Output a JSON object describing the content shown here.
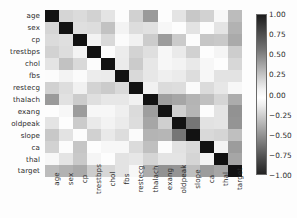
{
  "chart_data": {
    "type": "heatmap",
    "title": "",
    "xlabel": "",
    "ylabel": "",
    "grid": false,
    "colormap": "gray-diverging",
    "vmin": -1.0,
    "vmax": 1.0,
    "legend_position": "right",
    "categories": [
      "age",
      "sex",
      "cp",
      "trestbps",
      "chol",
      "fbs",
      "restecg",
      "thalach",
      "exang",
      "oldpeak",
      "slope",
      "ca",
      "thal",
      "target"
    ],
    "x_tick_labels": [
      "age",
      "sex",
      "cp",
      "trestbps",
      "chol",
      "fbs",
      "restecg",
      "thalach",
      "exang",
      "oldpeak",
      "slope",
      "ca",
      "thal",
      "target"
    ],
    "y_tick_labels": [
      "age",
      "sex",
      "cp",
      "trestbps",
      "chol",
      "fbs",
      "restecg",
      "thalach",
      "exang",
      "oldpeak",
      "slope",
      "ca",
      "thal",
      "target"
    ],
    "colorbar_ticks": [
      "1.00",
      "0.75",
      "0.50",
      "0.25",
      "0.00",
      "-0.25",
      "-0.50",
      "-0.75",
      "-1.00"
    ],
    "colorbar_tick_values": [
      1.0,
      0.75,
      0.5,
      0.25,
      0.0,
      -0.25,
      -0.5,
      -0.75,
      -1.0
    ],
    "matrix": [
      [
        1.0,
        -0.1,
        -0.07,
        0.28,
        0.21,
        0.12,
        -0.12,
        -0.4,
        0.1,
        0.21,
        -0.17,
        0.28,
        0.07,
        -0.23
      ],
      [
        -0.1,
        1.0,
        -0.05,
        -0.06,
        -0.2,
        0.05,
        -0.06,
        -0.04,
        0.14,
        0.1,
        -0.03,
        0.12,
        0.21,
        -0.28
      ],
      [
        -0.07,
        -0.05,
        1.0,
        0.05,
        -0.08,
        0.09,
        0.04,
        0.3,
        -0.39,
        -0.15,
        0.12,
        -0.18,
        -0.16,
        0.43
      ],
      [
        0.28,
        -0.06,
        0.05,
        1.0,
        0.12,
        0.18,
        -0.11,
        -0.05,
        0.07,
        0.19,
        -0.12,
        0.1,
        0.06,
        -0.14
      ],
      [
        0.21,
        -0.2,
        -0.08,
        0.12,
        1.0,
        0.01,
        -0.15,
        -0.01,
        0.07,
        0.05,
        -0.0,
        0.07,
        0.1,
        -0.09
      ],
      [
        0.12,
        0.05,
        0.09,
        0.18,
        0.01,
        1.0,
        -0.08,
        -0.01,
        0.03,
        0.01,
        -0.06,
        0.14,
        -0.03,
        -0.03
      ],
      [
        -0.12,
        -0.06,
        0.04,
        -0.11,
        -0.15,
        -0.08,
        1.0,
        0.04,
        -0.07,
        -0.06,
        0.09,
        -0.07,
        -0.01,
        0.14
      ],
      [
        -0.4,
        -0.04,
        0.3,
        -0.05,
        -0.01,
        -0.01,
        0.04,
        1.0,
        -0.38,
        -0.34,
        0.39,
        -0.21,
        -0.1,
        0.42
      ],
      [
        0.1,
        0.14,
        -0.39,
        0.07,
        0.07,
        0.03,
        -0.07,
        -0.38,
        1.0,
        0.29,
        -0.26,
        0.12,
        0.21,
        -0.44
      ],
      [
        0.21,
        0.1,
        -0.15,
        0.19,
        0.05,
        0.01,
        -0.06,
        -0.34,
        0.29,
        1.0,
        -0.58,
        0.22,
        0.21,
        -0.43
      ],
      [
        -0.17,
        -0.03,
        0.12,
        -0.12,
        -0.0,
        -0.06,
        0.09,
        0.39,
        -0.26,
        -0.58,
        1.0,
        -0.08,
        -0.1,
        0.35
      ],
      [
        0.28,
        0.12,
        -0.18,
        0.1,
        0.07,
        0.14,
        -0.07,
        -0.21,
        0.12,
        0.22,
        -0.08,
        1.0,
        0.15,
        -0.39
      ],
      [
        0.07,
        0.21,
        -0.16,
        0.06,
        0.1,
        -0.03,
        -0.01,
        -0.1,
        0.21,
        0.21,
        -0.1,
        0.15,
        1.0,
        -0.34
      ],
      [
        -0.23,
        -0.28,
        0.43,
        -0.14,
        -0.09,
        -0.03,
        0.14,
        0.42,
        -0.44,
        -0.43,
        0.35,
        -0.39,
        -0.34,
        1.0
      ]
    ]
  }
}
